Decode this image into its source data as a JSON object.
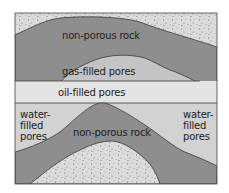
{
  "diagram": {
    "labels": {
      "top_rock": "non-porous rock",
      "gas": "gas-filled pores",
      "oil": "oil-filled pores",
      "water_left": [
        "water-",
        "filled",
        "pores"
      ],
      "water_right": [
        "water-",
        "filled",
        "pores"
      ],
      "bottom_rock": "non-porous rock"
    },
    "colors": {
      "speckled": "#d8d8d8",
      "rock": "#8e8e8e",
      "gas": "#c4c4c4",
      "oil": "#e4e4e4",
      "water": "#d2d2d2",
      "outline": "#3a3a3a"
    }
  }
}
